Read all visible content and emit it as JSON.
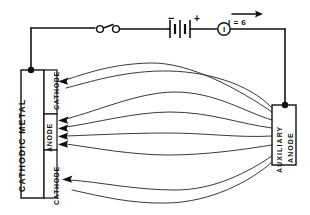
{
  "diagram": {
    "background_color": "#ffffff",
    "line_color": "#111111"
  },
  "electrodes": {
    "cathodic_metal": {
      "label": "CATHODIC   METAL",
      "segments": [
        {
          "name": "cathode-top",
          "label": "CATHODE"
        },
        {
          "name": "anode",
          "label": "ANODE"
        },
        {
          "name": "cathode-bottom",
          "label": "CATHODE"
        }
      ]
    },
    "auxiliary_anode": {
      "label_line1": "AUXILIARY",
      "label_line2": "ANODE"
    }
  },
  "circuit": {
    "switch": {
      "name": "switch",
      "state": "open"
    },
    "battery": {
      "name": "battery",
      "negative_terminal": "−",
      "positive_terminal": "+"
    },
    "ammeter": {
      "name": "ammeter",
      "symbol": "I"
    },
    "current": {
      "label": "I = 6",
      "direction": "right"
    }
  },
  "current_paths": {
    "to_cathode_top": 1,
    "to_anode": 4,
    "to_cathode_bottom": 1,
    "total": 6
  }
}
